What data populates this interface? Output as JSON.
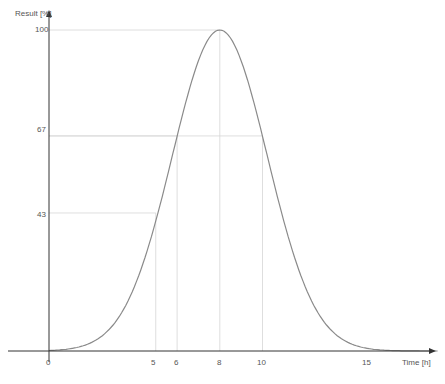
{
  "chart_data": {
    "type": "line",
    "title": "",
    "xlabel": "Time [h]",
    "ylabel": "Result [%]",
    "xlim": [
      0,
      18.2
    ],
    "ylim": [
      0,
      100
    ],
    "grid": false,
    "legend": null,
    "x_ticks": [
      0,
      5,
      6,
      8,
      10,
      15
    ],
    "y_ticks": [
      43,
      67,
      100
    ],
    "series": [
      {
        "name": "Result",
        "color": "#888888",
        "x": [
          0,
          1,
          2,
          3,
          4,
          5,
          6,
          7,
          8,
          9,
          10,
          11,
          12,
          13,
          14,
          15,
          16,
          17,
          18
        ],
        "y": [
          0,
          0.7,
          2.7,
          8.2,
          20.2,
          43,
          67,
          90.5,
          100,
          90.5,
          67,
          40.7,
          20.2,
          8.2,
          2.7,
          0.7,
          0.2,
          0,
          0
        ]
      }
    ],
    "annotations": [
      {
        "type": "guide",
        "x": 5,
        "y": 43
      },
      {
        "type": "guide",
        "x": 6,
        "y": 67
      },
      {
        "type": "guide",
        "x": 8,
        "y": 100
      },
      {
        "type": "guide",
        "x": 10,
        "y": 67
      }
    ]
  },
  "axes": {
    "x_label": "Time [h]",
    "y_label": "Result [%]",
    "x_tick_labels": [
      "0",
      "5",
      "6",
      "8",
      "10",
      "15"
    ],
    "y_tick_labels": [
      "43",
      "67",
      "100"
    ]
  },
  "colors": {
    "axis": "#333333",
    "curve": "#8a8a8a",
    "guide": "#d6d6d6",
    "text": "#555555"
  }
}
